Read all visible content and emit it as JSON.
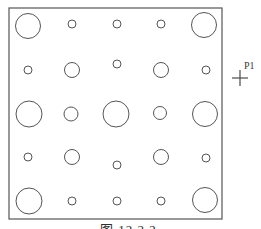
{
  "colors": {
    "line": "#555555",
    "background": "#ffffff",
    "caption_text": "#2e2e2e",
    "marker_line": "#4a4a4a"
  },
  "caption": {
    "text": "图 12.2.2"
  },
  "marker": {
    "label": "P1",
    "cx": 240,
    "cy": 78,
    "arm": 8,
    "label_x": 244,
    "label_y": 69
  },
  "diagram": {
    "border": {
      "x": 9,
      "y": 8,
      "width": 213,
      "height": 211
    },
    "grid": {
      "rows": 5,
      "cols": 5
    },
    "hole_sizes": {
      "large_radius": 13,
      "medium_radius": 7.5,
      "small_radius": 4
    },
    "circles": [
      {
        "cx": 28,
        "cy": 26,
        "r": 12.5
      },
      {
        "cx": 72,
        "cy": 24,
        "r": 4
      },
      {
        "cx": 117,
        "cy": 24,
        "r": 4
      },
      {
        "cx": 161,
        "cy": 24,
        "r": 4
      },
      {
        "cx": 204,
        "cy": 25,
        "r": 12.5
      },
      {
        "cx": 28,
        "cy": 70,
        "r": 4
      },
      {
        "cx": 72,
        "cy": 70,
        "r": 7.5
      },
      {
        "cx": 117,
        "cy": 64,
        "r": 4
      },
      {
        "cx": 161,
        "cy": 70,
        "r": 7.5
      },
      {
        "cx": 206,
        "cy": 70,
        "r": 4
      },
      {
        "cx": 29,
        "cy": 114,
        "r": 13
      },
      {
        "cx": 71,
        "cy": 114,
        "r": 7
      },
      {
        "cx": 116,
        "cy": 114,
        "r": 13
      },
      {
        "cx": 160,
        "cy": 113,
        "r": 6.5
      },
      {
        "cx": 205,
        "cy": 114,
        "r": 12.5
      },
      {
        "cx": 28,
        "cy": 157,
        "r": 4
      },
      {
        "cx": 72,
        "cy": 157,
        "r": 7.5
      },
      {
        "cx": 117,
        "cy": 165,
        "r": 4
      },
      {
        "cx": 161,
        "cy": 157,
        "r": 7.5
      },
      {
        "cx": 206,
        "cy": 158,
        "r": 4
      },
      {
        "cx": 29,
        "cy": 201,
        "r": 13
      },
      {
        "cx": 72,
        "cy": 201,
        "r": 4
      },
      {
        "cx": 117,
        "cy": 201,
        "r": 4
      },
      {
        "cx": 161,
        "cy": 201,
        "r": 4
      },
      {
        "cx": 205,
        "cy": 200,
        "r": 12.5
      }
    ],
    "caption_pos": {
      "x": 100,
      "baseline_y": 234
    }
  }
}
